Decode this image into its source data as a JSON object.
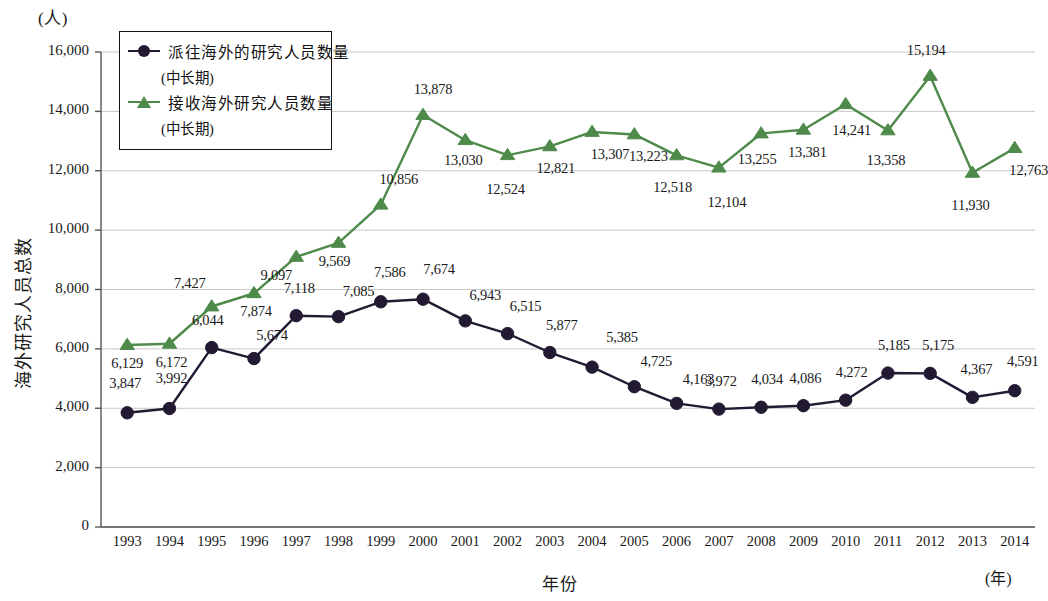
{
  "axis": {
    "unit_top": "(人)",
    "unit_right": "(年)",
    "ylabel": "海外研究人员总数",
    "xlabel": "年份"
  },
  "legend": {
    "entries": [
      {
        "label": "派往海外的研究人员数量",
        "sublabel": "(中长期)",
        "marker": "circle-marker",
        "color": "#221a33"
      },
      {
        "label": "接收海外研究人员数量",
        "sublabel": "(中长期)",
        "marker": "triangle-marker",
        "color": "#4e8a4a"
      }
    ]
  },
  "chart_data": {
    "type": "line",
    "title": "",
    "xlabel": "年份",
    "ylabel": "海外研究人员总数",
    "unit_y": "(人)",
    "unit_x": "(年)",
    "grid": true,
    "legend_position": "top-left",
    "ylim": [
      0,
      16000
    ],
    "yticks": [
      0,
      2000,
      4000,
      6000,
      8000,
      10000,
      12000,
      14000,
      16000
    ],
    "ytick_labels": [
      "0",
      "2,000",
      "4,000",
      "6,000",
      "8,000",
      "10,000",
      "12,000",
      "14,000",
      "16,000"
    ],
    "categories": [
      "1993",
      "1994",
      "1995",
      "1996",
      "1997",
      "1998",
      "1999",
      "2000",
      "2001",
      "2002",
      "2003",
      "2004",
      "2005",
      "2006",
      "2007",
      "2008",
      "2009",
      "2010",
      "2011",
      "2012",
      "2013",
      "2014"
    ],
    "series": [
      {
        "name": "派往海外的研究人员数量 (中长期)",
        "color": "#221a33",
        "marker": "circle",
        "values": [
          3847,
          3992,
          6044,
          5674,
          7118,
          7085,
          7586,
          7674,
          6943,
          6515,
          5877,
          5385,
          4725,
          4163,
          3972,
          4034,
          4086,
          4272,
          5185,
          5175,
          4367,
          4591
        ],
        "labels": [
          "3,847",
          "3,992",
          "6,044",
          "5,674",
          "7,118",
          "7,085",
          "7,586",
          "7,674",
          "6,943",
          "6,515",
          "5,877",
          "5,385",
          "4,725",
          "4,163",
          "3,972",
          "4,034",
          "4,086",
          "4,272",
          "5,185",
          "5,175",
          "4,367",
          "4,591"
        ]
      },
      {
        "name": "接收海外研究人员数量 (中长期)",
        "color": "#4e8a4a",
        "marker": "triangle",
        "values": [
          6129,
          6172,
          7427,
          7874,
          9097,
          9569,
          10856,
          13878,
          13030,
          12524,
          12821,
          13307,
          13223,
          12518,
          12104,
          13255,
          13381,
          14241,
          13358,
          15194,
          11930,
          12763
        ],
        "labels": [
          "6,129",
          "6,172",
          "7,427",
          "7,874",
          "9,097",
          "9,569",
          "10,856",
          "13,878",
          "13,030",
          "12,524",
          "12,821",
          "13,307",
          "13,223",
          "12,518",
          "12,104",
          "13,255",
          "13,381",
          "14,241",
          "13,358",
          "15,194",
          "11,930",
          "12,763"
        ]
      }
    ]
  }
}
